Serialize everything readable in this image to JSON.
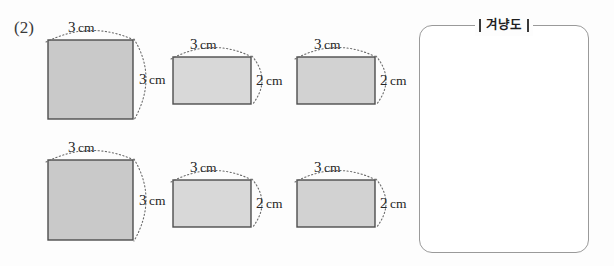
{
  "problem": {
    "number_label": "(2)"
  },
  "figures": [
    {
      "id": "figure-1",
      "shape": "square",
      "row": "top",
      "column": "left",
      "x": 48,
      "y": 40,
      "width": 85,
      "height": 79,
      "fill": "#c9c9c9",
      "stroke": "#4d4d4d",
      "top_label": {
        "value": "3",
        "unit": "cm"
      },
      "side_label": {
        "value": "3",
        "unit": "cm"
      }
    },
    {
      "id": "figure-2",
      "shape": "rectangle",
      "row": "top",
      "column": "center",
      "x": 173,
      "y": 57,
      "width": 78,
      "height": 47,
      "fill": "#d8d8d8",
      "stroke": "#4d4d4d",
      "top_label": {
        "value": "3",
        "unit": "cm"
      },
      "side_label": {
        "value": "2",
        "unit": "cm"
      }
    },
    {
      "id": "figure-3",
      "shape": "rectangle",
      "row": "top",
      "column": "right",
      "x": 297,
      "y": 57,
      "width": 78,
      "height": 47,
      "fill": "#d2d2d2",
      "stroke": "#4d4d4d",
      "top_label": {
        "value": "3",
        "unit": "cm"
      },
      "side_label": {
        "value": "2",
        "unit": "cm"
      }
    },
    {
      "id": "figure-4",
      "shape": "square",
      "row": "bottom",
      "column": "left",
      "x": 48,
      "y": 160,
      "width": 85,
      "height": 80,
      "fill": "#c9c9c9",
      "stroke": "#4d4d4d",
      "top_label": {
        "value": "3",
        "unit": "cm"
      },
      "side_label": {
        "value": "3",
        "unit": "cm"
      }
    },
    {
      "id": "figure-5",
      "shape": "rectangle",
      "row": "bottom",
      "column": "center",
      "x": 173,
      "y": 180,
      "width": 78,
      "height": 47,
      "fill": "#d8d8d8",
      "stroke": "#4d4d4d",
      "top_label": {
        "value": "3",
        "unit": "cm"
      },
      "side_label": {
        "value": "2",
        "unit": "cm"
      }
    },
    {
      "id": "figure-6",
      "shape": "rectangle",
      "row": "bottom",
      "column": "right",
      "x": 297,
      "y": 180,
      "width": 78,
      "height": 47,
      "fill": "#d2d2d2",
      "stroke": "#4d4d4d",
      "top_label": {
        "value": "3",
        "unit": "cm"
      },
      "side_label": {
        "value": "2",
        "unit": "cm"
      }
    }
  ],
  "answer_panel": {
    "legend_label": "겨냥도",
    "content": "",
    "border_color": "#9a9a9a"
  }
}
